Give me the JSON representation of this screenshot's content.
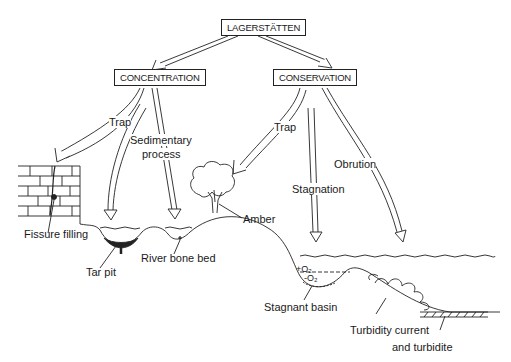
{
  "diagram": {
    "root": "LAGERSTÄTTEN",
    "branches": [
      {
        "label": "CONCENTRATION",
        "processes": [
          "Trap",
          "Sedimentary process"
        ],
        "deposits": [
          "Fissure filling",
          "Tar pit",
          "River bone bed"
        ]
      },
      {
        "label": "CONSERVATION",
        "processes": [
          "Trap",
          "Stagnation",
          "Obrution"
        ],
        "deposits": [
          "Amber",
          "Stagnant basin",
          "Turbidity current and turbidite"
        ]
      }
    ]
  },
  "labels": {
    "root": "LAGERSTÄTTEN",
    "concentration": "CONCENTRATION",
    "conservation": "CONSERVATION",
    "trap_left": "Trap",
    "sedimentary_1": "Sedimentary",
    "sedimentary_2": "process",
    "trap_right": "Trap",
    "stagnation": "Stagnation",
    "obrution": "Obrution",
    "fissure_filling": "Fissure filling",
    "tar_pit": "Tar pit",
    "river_bone_bed": "River bone bed",
    "amber": "Amber",
    "plus_o2": "+O₂",
    "minus_o2": "-O₂",
    "stagnant_basin": "Stagnant basin",
    "turbidity_1": "Turbidity current",
    "turbidity_2": "and turbidite"
  }
}
